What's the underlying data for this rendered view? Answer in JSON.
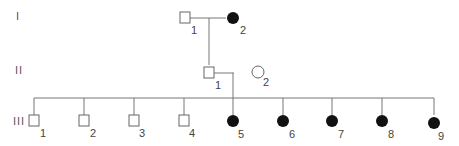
{
  "diagram": {
    "type": "pedigree",
    "generations": [
      {
        "label": "I",
        "members": [
          {
            "id": "I-1",
            "number": "1",
            "sex": "male",
            "affected": false
          },
          {
            "id": "I-2",
            "number": "2",
            "sex": "female",
            "affected": true
          }
        ]
      },
      {
        "label": "II",
        "members": [
          {
            "id": "II-1",
            "number": "1",
            "sex": "male",
            "affected": false
          },
          {
            "id": "II-2",
            "number": "2",
            "sex": "female",
            "affected": false
          }
        ]
      },
      {
        "label": "III",
        "members": [
          {
            "id": "III-1",
            "number": "1",
            "sex": "male",
            "affected": false
          },
          {
            "id": "III-2",
            "number": "2",
            "sex": "male",
            "affected": false
          },
          {
            "id": "III-3",
            "number": "3",
            "sex": "male",
            "affected": false
          },
          {
            "id": "III-4",
            "number": "4",
            "sex": "male",
            "affected": false
          },
          {
            "id": "III-5",
            "number": "5",
            "sex": "female",
            "affected": true
          },
          {
            "id": "III-6",
            "number": "6",
            "sex": "female",
            "affected": true
          },
          {
            "id": "III-7",
            "number": "7",
            "sex": "female",
            "affected": true
          },
          {
            "id": "III-8",
            "number": "8",
            "sex": "female",
            "affected": true
          },
          {
            "id": "III-9",
            "number": "9",
            "sex": "female",
            "affected": true
          }
        ]
      }
    ]
  }
}
